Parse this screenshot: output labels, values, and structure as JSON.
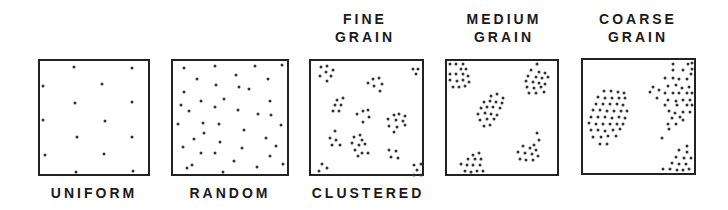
{
  "labels": {
    "uniform": "UNIFORM",
    "random": "RANDOM",
    "clustered": "CLUSTERED",
    "fine_1": "FINE",
    "fine_2": "GRAIN",
    "medium_1": "MEDIUM",
    "medium_2": "GRAIN",
    "coarse_1": "COARSE",
    "coarse_2": "GRAIN"
  },
  "panels": [
    {
      "id": "uniform",
      "x": 38,
      "y": 59,
      "w": 112,
      "h": 117,
      "dots": [
        [
          34,
          6
        ],
        [
          92,
          7
        ],
        [
          3,
          25
        ],
        [
          62,
          23
        ],
        [
          35,
          42
        ],
        [
          92,
          41
        ],
        [
          3,
          59
        ],
        [
          65,
          60
        ],
        [
          37,
          76
        ],
        [
          92,
          76
        ],
        [
          5,
          94
        ],
        [
          64,
          93
        ],
        [
          36,
          111
        ],
        [
          93,
          110
        ]
      ]
    },
    {
      "id": "random",
      "x": 171,
      "y": 59,
      "w": 118,
      "h": 117,
      "dots": [
        [
          11,
          7
        ],
        [
          42,
          5
        ],
        [
          82,
          5
        ],
        [
          109,
          4
        ],
        [
          24,
          18
        ],
        [
          63,
          14
        ],
        [
          95,
          18
        ],
        [
          43,
          24
        ],
        [
          66,
          26
        ],
        [
          76,
          28
        ],
        [
          11,
          31
        ],
        [
          51,
          38
        ],
        [
          8,
          44
        ],
        [
          28,
          40
        ],
        [
          42,
          46
        ],
        [
          65,
          49
        ],
        [
          97,
          40
        ],
        [
          16,
          50
        ],
        [
          85,
          53
        ],
        [
          98,
          54
        ],
        [
          5,
          63
        ],
        [
          30,
          62
        ],
        [
          46,
          63
        ],
        [
          71,
          69
        ],
        [
          108,
          64
        ],
        [
          31,
          72
        ],
        [
          21,
          78
        ],
        [
          47,
          81
        ],
        [
          93,
          77
        ],
        [
          103,
          85
        ],
        [
          10,
          86
        ],
        [
          28,
          92
        ],
        [
          42,
          92
        ],
        [
          69,
          87
        ],
        [
          97,
          95
        ],
        [
          19,
          104
        ],
        [
          61,
          100
        ],
        [
          84,
          106
        ],
        [
          110,
          103
        ],
        [
          50,
          111
        ],
        [
          14,
          107
        ]
      ]
    },
    {
      "id": "fine",
      "x": 309,
      "y": 59,
      "w": 115,
      "h": 117,
      "dots": [
        [
          10,
          6
        ],
        [
          16,
          5
        ],
        [
          22,
          9
        ],
        [
          15,
          11
        ],
        [
          9,
          15
        ],
        [
          20,
          15
        ],
        [
          16,
          20
        ],
        [
          102,
          8
        ],
        [
          107,
          8
        ],
        [
          105,
          13
        ],
        [
          62,
          18
        ],
        [
          68,
          17
        ],
        [
          57,
          22
        ],
        [
          63,
          25
        ],
        [
          71,
          23
        ],
        [
          69,
          30
        ],
        [
          26,
          39
        ],
        [
          32,
          37
        ],
        [
          24,
          44
        ],
        [
          30,
          44
        ],
        [
          22,
          50
        ],
        [
          28,
          50
        ],
        [
          46,
          53
        ],
        [
          52,
          50
        ],
        [
          57,
          49
        ],
        [
          58,
          56
        ],
        [
          52,
          61
        ],
        [
          83,
          54
        ],
        [
          88,
          53
        ],
        [
          94,
          55
        ],
        [
          77,
          58
        ],
        [
          85,
          59
        ],
        [
          92,
          60
        ],
        [
          78,
          65
        ],
        [
          86,
          66
        ],
        [
          94,
          64
        ],
        [
          83,
          71
        ],
        [
          24,
          70
        ],
        [
          19,
          77
        ],
        [
          25,
          79
        ],
        [
          21,
          84
        ],
        [
          29,
          84
        ],
        [
          43,
          76
        ],
        [
          49,
          74
        ],
        [
          51,
          79
        ],
        [
          41,
          82
        ],
        [
          48,
          84
        ],
        [
          54,
          83
        ],
        [
          44,
          89
        ],
        [
          51,
          92
        ],
        [
          57,
          92
        ],
        [
          47,
          95
        ],
        [
          78,
          89
        ],
        [
          85,
          90
        ],
        [
          80,
          96
        ],
        [
          87,
          97
        ],
        [
          11,
          103
        ],
        [
          16,
          107
        ],
        [
          8,
          110
        ],
        [
          103,
          104
        ],
        [
          110,
          103
        ],
        [
          106,
          109
        ],
        [
          103,
          114
        ],
        [
          110,
          114
        ]
      ]
    },
    {
      "id": "medium",
      "x": 445,
      "y": 59,
      "w": 114,
      "h": 117,
      "dots": [
        [
          3,
          3
        ],
        [
          9,
          3
        ],
        [
          16,
          3
        ],
        [
          14,
          8
        ],
        [
          19,
          8
        ],
        [
          3,
          13
        ],
        [
          9,
          13
        ],
        [
          16,
          13
        ],
        [
          21,
          15
        ],
        [
          3,
          19
        ],
        [
          10,
          20
        ],
        [
          16,
          19
        ],
        [
          22,
          21
        ],
        [
          6,
          26
        ],
        [
          12,
          26
        ],
        [
          18,
          25
        ],
        [
          90,
          3
        ],
        [
          84,
          9
        ],
        [
          92,
          11
        ],
        [
          98,
          12
        ],
        [
          81,
          15
        ],
        [
          89,
          16
        ],
        [
          95,
          17
        ],
        [
          101,
          16
        ],
        [
          79,
          20
        ],
        [
          86,
          21
        ],
        [
          92,
          22
        ],
        [
          98,
          23
        ],
        [
          80,
          26
        ],
        [
          87,
          27
        ],
        [
          94,
          26
        ],
        [
          82,
          32
        ],
        [
          89,
          32
        ],
        [
          97,
          31
        ],
        [
          44,
          35
        ],
        [
          50,
          33
        ],
        [
          56,
          37
        ],
        [
          37,
          41
        ],
        [
          43,
          40
        ],
        [
          49,
          41
        ],
        [
          55,
          42
        ],
        [
          34,
          47
        ],
        [
          40,
          46
        ],
        [
          46,
          46
        ],
        [
          53,
          47
        ],
        [
          31,
          53
        ],
        [
          38,
          52
        ],
        [
          44,
          53
        ],
        [
          50,
          54
        ],
        [
          33,
          59
        ],
        [
          40,
          58
        ],
        [
          47,
          58
        ],
        [
          37,
          65
        ],
        [
          43,
          64
        ],
        [
          90,
          72
        ],
        [
          92,
          79
        ],
        [
          87,
          84
        ],
        [
          76,
          85
        ],
        [
          83,
          87
        ],
        [
          89,
          89
        ],
        [
          71,
          91
        ],
        [
          78,
          92
        ],
        [
          85,
          93
        ],
        [
          91,
          95
        ],
        [
          73,
          98
        ],
        [
          79,
          99
        ],
        [
          86,
          99
        ],
        [
          26,
          94
        ],
        [
          32,
          92
        ],
        [
          21,
          98
        ],
        [
          28,
          98
        ],
        [
          34,
          98
        ],
        [
          14,
          103
        ],
        [
          20,
          104
        ],
        [
          26,
          104
        ],
        [
          33,
          104
        ],
        [
          18,
          110
        ],
        [
          24,
          111
        ],
        [
          30,
          110
        ],
        [
          36,
          110
        ]
      ]
    },
    {
      "id": "coarse",
      "x": 581,
      "y": 58,
      "w": 115,
      "h": 117,
      "dots": [
        [
          90,
          4
        ],
        [
          105,
          4
        ],
        [
          109,
          3
        ],
        [
          109,
          9
        ],
        [
          90,
          10
        ],
        [
          100,
          10
        ],
        [
          108,
          14
        ],
        [
          82,
          18
        ],
        [
          90,
          18
        ],
        [
          96,
          19
        ],
        [
          104,
          19
        ],
        [
          70,
          27
        ],
        [
          76,
          30
        ],
        [
          85,
          26
        ],
        [
          93,
          25
        ],
        [
          99,
          28
        ],
        [
          106,
          27
        ],
        [
          67,
          32
        ],
        [
          82,
          33
        ],
        [
          90,
          33
        ],
        [
          96,
          33
        ],
        [
          104,
          33
        ],
        [
          109,
          33
        ],
        [
          74,
          38
        ],
        [
          85,
          40
        ],
        [
          93,
          41
        ],
        [
          100,
          40
        ],
        [
          107,
          40
        ],
        [
          82,
          45
        ],
        [
          94,
          45
        ],
        [
          104,
          45
        ],
        [
          109,
          45
        ],
        [
          86,
          51
        ],
        [
          92,
          53
        ],
        [
          100,
          52
        ],
        [
          107,
          52
        ],
        [
          89,
          58
        ],
        [
          97,
          57
        ],
        [
          100,
          60
        ],
        [
          85,
          64
        ],
        [
          93,
          64
        ],
        [
          86,
          69
        ],
        [
          79,
          78
        ],
        [
          21,
          31
        ],
        [
          28,
          31
        ],
        [
          35,
          32
        ],
        [
          41,
          33
        ],
        [
          15,
          37
        ],
        [
          22,
          38
        ],
        [
          29,
          38
        ],
        [
          36,
          38
        ],
        [
          42,
          38
        ],
        [
          13,
          44
        ],
        [
          20,
          44
        ],
        [
          27,
          44
        ],
        [
          34,
          44
        ],
        [
          40,
          45
        ],
        [
          10,
          50
        ],
        [
          17,
          50
        ],
        [
          24,
          51
        ],
        [
          31,
          51
        ],
        [
          38,
          51
        ],
        [
          44,
          51
        ],
        [
          8,
          57
        ],
        [
          15,
          57
        ],
        [
          22,
          57
        ],
        [
          29,
          58
        ],
        [
          36,
          57
        ],
        [
          42,
          58
        ],
        [
          6,
          63
        ],
        [
          13,
          64
        ],
        [
          20,
          64
        ],
        [
          27,
          64
        ],
        [
          34,
          64
        ],
        [
          40,
          64
        ],
        [
          8,
          70
        ],
        [
          15,
          70
        ],
        [
          22,
          71
        ],
        [
          30,
          70
        ],
        [
          37,
          69
        ],
        [
          10,
          77
        ],
        [
          18,
          77
        ],
        [
          25,
          76
        ],
        [
          33,
          76
        ],
        [
          17,
          84
        ],
        [
          24,
          84
        ],
        [
          104,
          86
        ],
        [
          96,
          90
        ],
        [
          104,
          92
        ],
        [
          93,
          97
        ],
        [
          101,
          98
        ],
        [
          108,
          98
        ],
        [
          89,
          103
        ],
        [
          96,
          104
        ],
        [
          103,
          104
        ],
        [
          80,
          109
        ],
        [
          87,
          109
        ],
        [
          94,
          110
        ],
        [
          100,
          110
        ],
        [
          106,
          109
        ]
      ]
    }
  ]
}
